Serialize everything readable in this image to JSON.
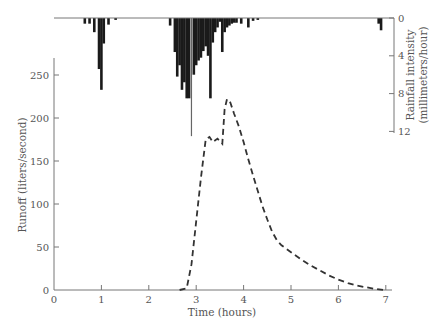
{
  "chart_data": [
    {
      "type": "line",
      "title": "",
      "xlabel": "Time (hours)",
      "ylabel": "Runoff (liters/second)",
      "xlim": [
        0,
        7
      ],
      "ylim": [
        0,
        270
      ],
      "x_ticks": [
        0,
        1,
        2,
        3,
        4,
        5,
        6,
        7
      ],
      "y_ticks": [
        0,
        50,
        100,
        150,
        200,
        250
      ],
      "grid": false,
      "series": [
        {
          "name": "Runoff",
          "style": "dashed",
          "x": [
            2.65,
            2.8,
            2.9,
            3.0,
            3.1,
            3.2,
            3.28,
            3.35,
            3.45,
            3.55,
            3.6,
            3.65,
            3.72,
            3.8,
            3.9,
            4.0,
            4.1,
            4.2,
            4.3,
            4.4,
            4.5,
            4.6,
            4.7,
            4.8,
            5.0,
            5.2,
            5.4,
            5.6,
            5.8,
            6.0,
            6.2,
            6.4,
            6.6,
            6.8,
            6.95
          ],
          "values": [
            0,
            2,
            30,
            80,
            130,
            175,
            178,
            172,
            176,
            170,
            210,
            222,
            218,
            205,
            190,
            172,
            152,
            133,
            115,
            97,
            82,
            68,
            58,
            52,
            44,
            36,
            29,
            23,
            17,
            12,
            8,
            5,
            3,
            1,
            0
          ]
        }
      ]
    },
    {
      "type": "bar",
      "orientation": "inverted",
      "title": "",
      "ylabel": "Rainfall intensity (millimeters/hour)",
      "ylim": [
        0,
        12
      ],
      "y_ticks": [
        0,
        4,
        8,
        12
      ],
      "axis_position": "right",
      "series": [
        {
          "name": "Rainfall intensity",
          "x": [
            0.65,
            0.75,
            0.85,
            0.95,
            1.0,
            1.05,
            1.15,
            1.3,
            2.45,
            2.55,
            2.6,
            2.65,
            2.7,
            2.75,
            2.8,
            2.85,
            2.9,
            2.95,
            3.0,
            3.05,
            3.1,
            3.15,
            3.2,
            3.25,
            3.3,
            3.35,
            3.4,
            3.45,
            3.5,
            3.55,
            3.6,
            3.65,
            3.7,
            3.75,
            3.8,
            3.85,
            3.95,
            4.1,
            4.2,
            4.3,
            6.85,
            6.9
          ],
          "values": [
            0.6,
            0.6,
            1.5,
            5.4,
            7.6,
            2.7,
            0.7,
            0.2,
            0.8,
            3.6,
            6.2,
            5.0,
            7.6,
            6.8,
            8.5,
            8.5,
            12.5,
            6.0,
            5.0,
            4.5,
            4.2,
            3.5,
            3.0,
            4.0,
            8.5,
            2.6,
            1.5,
            1.0,
            0.4,
            3.6,
            1.5,
            1.0,
            0.8,
            0.6,
            0.5,
            0.5,
            0.6,
            1.0,
            0.3,
            0.2,
            0.6,
            1.3
          ]
        }
      ]
    }
  ],
  "labels": {
    "xlabel": "Time (hours)",
    "ylabel_left": "Runoff (liters/second)",
    "ylabel_right_line1": "Rainfall intensity",
    "ylabel_right_line2": "(millimeters/hour)",
    "x_ticks": [
      "0",
      "1",
      "2",
      "3",
      "4",
      "5",
      "6",
      "7"
    ],
    "y_left_ticks": [
      "0",
      "50",
      "100",
      "150",
      "200",
      "250"
    ],
    "y_right_ticks": [
      "0",
      "4",
      "8",
      "12"
    ]
  }
}
